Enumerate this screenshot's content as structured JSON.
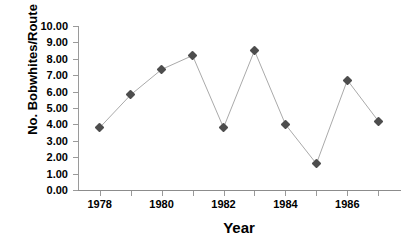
{
  "chart_data": {
    "type": "line",
    "title": "",
    "xlabel": "Year",
    "ylabel": "No. Bobwhites/Route",
    "x": [
      1978,
      1979,
      1980,
      1981,
      1982,
      1983,
      1984,
      1985,
      1986,
      1987
    ],
    "values": [
      3.8,
      5.8,
      7.35,
      8.2,
      3.8,
      8.5,
      4.0,
      1.6,
      6.7,
      4.2
    ],
    "xlim": [
      1977.3,
      1987.7
    ],
    "ylim": [
      0.0,
      10.0
    ],
    "grid": false,
    "legend": "none",
    "marker": "diamond",
    "marker_color": "#4d4d4d",
    "line_color": "#aaaaaa",
    "y_ticks": [
      "0.00",
      "1.00",
      "2.00",
      "3.00",
      "4.00",
      "5.00",
      "6.00",
      "7.00",
      "8.00",
      "9.00",
      "10.00"
    ],
    "y_tick_values": [
      0,
      1,
      2,
      3,
      4,
      5,
      6,
      7,
      8,
      9,
      10
    ],
    "x_ticks": [
      1978,
      1979,
      1980,
      1981,
      1982,
      1983,
      1984,
      1985,
      1986,
      1987
    ],
    "x_tick_labels": [
      "1978",
      "",
      "1980",
      "",
      "1982",
      "",
      "1984",
      "",
      "1986",
      ""
    ],
    "background": "#ffffff",
    "axis_color": "#9a9a9a"
  }
}
